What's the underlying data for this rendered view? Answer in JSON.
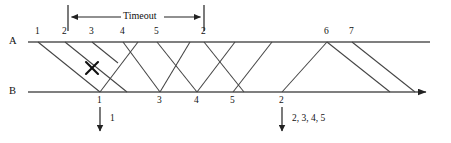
{
  "diagram": {
    "type": "protocol-timing-diagram",
    "colors": {
      "line": "#555555",
      "arrow": "#222222",
      "text": "#111111",
      "background": "#ffffff"
    },
    "hosts": [
      {
        "id": "A",
        "label": "A",
        "x": 13,
        "y": 42,
        "line_y": 42
      },
      {
        "id": "B",
        "label": "B",
        "x": 13,
        "y": 92,
        "line_y": 92
      }
    ],
    "timeout": {
      "label": "Timeout",
      "start_x": 68,
      "end_x": 204,
      "y": 17,
      "tick_top": 5,
      "tick_bottom": 31
    },
    "sender_labels": [
      {
        "text": "1",
        "x": 38,
        "y": 33
      },
      {
        "text": "2",
        "x": 65,
        "y": 33
      },
      {
        "text": "3",
        "x": 92,
        "y": 33
      },
      {
        "text": "4",
        "x": 123,
        "y": 33
      },
      {
        "text": "5",
        "x": 157,
        "y": 33
      },
      {
        "text": "2",
        "x": 204,
        "y": 33
      },
      {
        "text": "6",
        "x": 327,
        "y": 33
      },
      {
        "text": "7",
        "x": 352,
        "y": 33
      }
    ],
    "receiver_labels": [
      {
        "text": "1",
        "x": 100,
        "y": 100
      },
      {
        "text": "3",
        "x": 160,
        "y": 100
      },
      {
        "text": "4",
        "x": 197,
        "y": 100
      },
      {
        "text": "5",
        "x": 233,
        "y": 100
      },
      {
        "text": "2",
        "x": 282,
        "y": 100
      }
    ],
    "deliveries": [
      {
        "text": "1",
        "arrow_x": 100,
        "arrow_y_start": 107,
        "arrow_y_end": 134,
        "label_x": 112,
        "label_y": 121
      },
      {
        "text": "2, 3, 4, 5",
        "arrow_x": 282,
        "arrow_y_start": 107,
        "arrow_y_end": 134,
        "label_x": 294,
        "label_y": 121
      }
    ],
    "frames_down": [
      {
        "name": "frame-1",
        "from_x": 38,
        "to_x": 100,
        "lost": false
      },
      {
        "name": "frame-2",
        "from_x": 65,
        "to_x": 127,
        "lost": false
      },
      {
        "name": "frame-3-lost",
        "from_x": 92,
        "to_x": 120,
        "lost": true,
        "x_mark_x": 92,
        "x_mark_y": 68
      },
      {
        "name": "frame-4",
        "from_x": 123,
        "to_x": 160,
        "lost": false
      },
      {
        "name": "frame-5",
        "from_x": 157,
        "to_x": 197,
        "lost": false
      },
      {
        "name": "frame-2-retransmit",
        "from_x": 204,
        "to_x": 244,
        "lost": false
      },
      {
        "name": "frame-6",
        "from_x": 327,
        "to_x": 390,
        "lost": false
      },
      {
        "name": "frame-7",
        "from_x": 352,
        "to_x": 415,
        "lost": false
      }
    ],
    "acks_up": [
      {
        "name": "ack-1",
        "from_x": 100,
        "to_x": 138
      },
      {
        "name": "ack-3",
        "from_x": 160,
        "to_x": 190
      },
      {
        "name": "ack-4",
        "from_x": 197,
        "to_x": 235
      },
      {
        "name": "ack-5",
        "from_x": 233,
        "to_x": 272
      },
      {
        "name": "ack-2",
        "from_x": 282,
        "to_x": 327
      }
    ],
    "axis_end": {
      "a_line_end_x": 430,
      "b_line_end_x": 430,
      "b_arrowhead": true,
      "a_arrowhead": false
    }
  }
}
